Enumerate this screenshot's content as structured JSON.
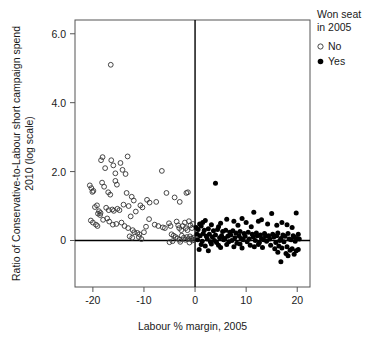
{
  "chart_data": {
    "type": "scatter",
    "title": "",
    "xlabel": "Labour % margin, 2005",
    "ylabel_line1": "Ratio of Conservative-to-Labour short campaign spend",
    "ylabel_line2": "2010 (log scale)",
    "xlim": [
      -23.5,
      22.5
    ],
    "ylim": [
      -1.35,
      6.4
    ],
    "xticks": [
      -20,
      -10,
      0,
      10,
      20
    ],
    "xticklabels": [
      "-20",
      "-10",
      "0",
      "10",
      "20"
    ],
    "yticks": [
      0,
      2.0,
      4.0,
      6.0
    ],
    "yticklabels": [
      "0",
      "2.0",
      "4.0",
      "6.0"
    ],
    "grid": false,
    "reference_lines": {
      "x": 0,
      "y": 0
    },
    "legend": {
      "title_line1": "Won seat",
      "title_line2": "in 2005",
      "position": "right-top",
      "entries": [
        {
          "label": "No",
          "marker": "open-circle",
          "color": "#333333"
        },
        {
          "label": "Yes",
          "marker": "filled-circle",
          "color": "#000000"
        }
      ]
    },
    "series": [
      {
        "name": "No",
        "marker": "open-circle",
        "color": "#333333",
        "points": [
          [
            -16.5,
            5.1
          ],
          [
            -18.4,
            2.33
          ],
          [
            -18.1,
            2.42
          ],
          [
            -17.6,
            2.1
          ],
          [
            -16.4,
            2.33
          ],
          [
            -16.0,
            2.18
          ],
          [
            -15.6,
            1.95
          ],
          [
            -13.2,
            2.44
          ],
          [
            -14.6,
            2.25
          ],
          [
            -14.2,
            2.05
          ],
          [
            -13.6,
            1.93
          ],
          [
            -6.5,
            2.02
          ],
          [
            -20.6,
            1.6
          ],
          [
            -20.3,
            1.52
          ],
          [
            -20.1,
            1.41
          ],
          [
            -19.9,
            1.44
          ],
          [
            -18.2,
            1.68
          ],
          [
            -17.8,
            1.56
          ],
          [
            -15.6,
            1.73
          ],
          [
            -15.3,
            1.62
          ],
          [
            -17.0,
            1.4
          ],
          [
            -16.6,
            1.33
          ],
          [
            -13.4,
            1.38
          ],
          [
            -12.4,
            1.27
          ],
          [
            -12.0,
            1.16
          ],
          [
            -9.4,
            1.18
          ],
          [
            -8.9,
            1.1
          ],
          [
            -7.6,
            1.12
          ],
          [
            -5.6,
            1.38
          ],
          [
            -4.0,
            1.25
          ],
          [
            -3.0,
            1.12
          ],
          [
            -1.7,
            1.38
          ],
          [
            -1.4,
            1.4
          ],
          [
            -19.6,
            0.97
          ],
          [
            -19.2,
            1.02
          ],
          [
            -18.8,
            0.85
          ],
          [
            -18.5,
            0.8
          ],
          [
            -19.0,
            0.78
          ],
          [
            -18.6,
            0.74
          ],
          [
            -17.4,
            0.95
          ],
          [
            -16.9,
            0.88
          ],
          [
            -16.2,
            0.9
          ],
          [
            -15.9,
            0.86
          ],
          [
            -15.2,
            0.92
          ],
          [
            -14.8,
            0.88
          ],
          [
            -14.0,
            1.04
          ],
          [
            -13.0,
            1.0
          ],
          [
            -12.6,
            0.7
          ],
          [
            -11.6,
            0.84
          ],
          [
            -10.7,
            1.02
          ],
          [
            -10.3,
            0.96
          ],
          [
            -9.0,
            0.62
          ],
          [
            -20.4,
            0.58
          ],
          [
            -20.0,
            0.52
          ],
          [
            -19.4,
            0.46
          ],
          [
            -19.1,
            0.42
          ],
          [
            -18.0,
            0.6
          ],
          [
            -17.2,
            0.64
          ],
          [
            -16.8,
            0.55
          ],
          [
            -16.1,
            0.46
          ],
          [
            -15.4,
            0.48
          ],
          [
            -14.4,
            0.52
          ],
          [
            -13.8,
            0.42
          ],
          [
            -13.1,
            0.36
          ],
          [
            -12.2,
            0.3
          ],
          [
            -11.9,
            0.24
          ],
          [
            -11.3,
            0.22
          ],
          [
            -10.9,
            0.18
          ],
          [
            -10.0,
            0.24
          ],
          [
            -9.6,
            0.4
          ],
          [
            -6.3,
            0.38
          ],
          [
            -5.9,
            0.36
          ],
          [
            -5.1,
            0.5
          ],
          [
            -4.8,
            0.42
          ],
          [
            -3.6,
            0.55
          ],
          [
            -3.3,
            0.44
          ],
          [
            -3.1,
            0.36
          ],
          [
            -2.7,
            0.3
          ],
          [
            -2.4,
            0.42
          ],
          [
            -2.0,
            0.52
          ],
          [
            -1.8,
            0.36
          ],
          [
            -1.5,
            0.3
          ],
          [
            -1.2,
            0.56
          ],
          [
            -0.9,
            0.44
          ],
          [
            -0.6,
            0.36
          ],
          [
            -0.4,
            0.48
          ],
          [
            -4.6,
            0.18
          ],
          [
            -4.2,
            0.14
          ],
          [
            -3.8,
            0.1
          ],
          [
            -3.4,
            0.06
          ],
          [
            -3.0,
            0.02
          ],
          [
            -2.6,
            0.14
          ],
          [
            -2.2,
            0.08
          ],
          [
            -1.9,
            0.02
          ],
          [
            -1.6,
            0.1
          ],
          [
            -1.3,
            0.04
          ],
          [
            -1.0,
            0.12
          ],
          [
            -0.7,
            0.06
          ],
          [
            -0.5,
            0.0
          ],
          [
            -0.3,
            0.08
          ],
          [
            -0.2,
            0.02
          ],
          [
            -5.0,
            -0.05
          ],
          [
            -4.4,
            -0.02
          ],
          [
            -2.9,
            -0.04
          ],
          [
            -1.1,
            -0.06
          ],
          [
            -12.8,
            0.12
          ],
          [
            -12.3,
            0.08
          ],
          [
            -11.0,
            0.1
          ],
          [
            -10.5,
            0.04
          ],
          [
            -7.9,
            0.46
          ],
          [
            -7.2,
            0.42
          ]
        ]
      },
      {
        "name": "Yes",
        "marker": "filled-circle",
        "color": "#000000",
        "points": [
          [
            4.0,
            1.66
          ],
          [
            11.5,
            0.82
          ],
          [
            15.0,
            0.78
          ],
          [
            19.8,
            0.8
          ],
          [
            9.2,
            0.64
          ],
          [
            13.0,
            0.6
          ],
          [
            6.2,
            0.62
          ],
          [
            2.0,
            0.58
          ],
          [
            7.6,
            0.56
          ],
          [
            12.4,
            0.56
          ],
          [
            17.0,
            0.52
          ],
          [
            5.0,
            0.5
          ],
          [
            10.0,
            0.52
          ],
          [
            14.2,
            0.48
          ],
          [
            18.0,
            0.46
          ],
          [
            3.2,
            0.46
          ],
          [
            8.4,
            0.44
          ],
          [
            16.0,
            0.44
          ],
          [
            1.2,
            0.42
          ],
          [
            4.6,
            0.4
          ],
          [
            11.0,
            0.4
          ],
          [
            19.0,
            0.38
          ],
          [
            0.6,
            0.32
          ],
          [
            1.8,
            0.3
          ],
          [
            2.6,
            0.34
          ],
          [
            3.6,
            0.28
          ],
          [
            4.4,
            0.32
          ],
          [
            5.4,
            0.26
          ],
          [
            6.0,
            0.3
          ],
          [
            6.8,
            0.24
          ],
          [
            7.4,
            0.28
          ],
          [
            8.0,
            0.22
          ],
          [
            8.8,
            0.26
          ],
          [
            9.6,
            0.2
          ],
          [
            10.4,
            0.24
          ],
          [
            11.2,
            0.18
          ],
          [
            12.0,
            0.22
          ],
          [
            12.8,
            0.16
          ],
          [
            13.6,
            0.2
          ],
          [
            14.4,
            0.14
          ],
          [
            15.2,
            0.18
          ],
          [
            16.2,
            0.22
          ],
          [
            17.2,
            0.16
          ],
          [
            18.2,
            0.2
          ],
          [
            19.2,
            0.14
          ],
          [
            20.2,
            0.18
          ],
          [
            0.4,
            0.18
          ],
          [
            1.0,
            0.14
          ],
          [
            1.6,
            0.2
          ],
          [
            2.2,
            0.12
          ],
          [
            2.8,
            0.18
          ],
          [
            3.4,
            0.1
          ],
          [
            4.0,
            0.16
          ],
          [
            4.8,
            0.08
          ],
          [
            5.2,
            0.14
          ],
          [
            5.8,
            0.06
          ],
          [
            6.4,
            0.12
          ],
          [
            7.0,
            0.16
          ],
          [
            7.8,
            0.08
          ],
          [
            8.6,
            0.14
          ],
          [
            9.0,
            0.06
          ],
          [
            9.8,
            0.12
          ],
          [
            10.6,
            0.04
          ],
          [
            11.4,
            0.1
          ],
          [
            12.2,
            0.14
          ],
          [
            13.0,
            0.06
          ],
          [
            13.8,
            0.12
          ],
          [
            14.6,
            0.04
          ],
          [
            15.4,
            0.1
          ],
          [
            16.0,
            0.14
          ],
          [
            16.8,
            0.06
          ],
          [
            17.6,
            0.12
          ],
          [
            18.4,
            0.04
          ],
          [
            19.4,
            0.1
          ],
          [
            20.0,
            0.06
          ],
          [
            0.5,
            0.02
          ],
          [
            1.4,
            -0.02
          ],
          [
            2.4,
            0.04
          ],
          [
            3.0,
            -0.04
          ],
          [
            3.8,
            0.0
          ],
          [
            4.2,
            -0.06
          ],
          [
            5.6,
            0.02
          ],
          [
            6.6,
            -0.04
          ],
          [
            7.2,
            0.0
          ],
          [
            8.2,
            -0.08
          ],
          [
            9.4,
            0.02
          ],
          [
            10.2,
            -0.04
          ],
          [
            11.8,
            0.0
          ],
          [
            12.6,
            -0.06
          ],
          [
            13.4,
            0.02
          ],
          [
            14.0,
            -0.02
          ],
          [
            15.8,
            -0.06
          ],
          [
            16.6,
            0.0
          ],
          [
            17.4,
            -0.04
          ],
          [
            18.8,
            0.02
          ],
          [
            19.6,
            -0.02
          ],
          [
            20.4,
            0.04
          ],
          [
            1.2,
            -0.12
          ],
          [
            2.0,
            -0.16
          ],
          [
            3.2,
            -0.1
          ],
          [
            4.6,
            -0.14
          ],
          [
            5.0,
            -0.2
          ],
          [
            6.2,
            -0.12
          ],
          [
            7.6,
            -0.18
          ],
          [
            8.8,
            -0.1
          ],
          [
            9.2,
            -0.22
          ],
          [
            10.8,
            -0.14
          ],
          [
            11.6,
            -0.18
          ],
          [
            12.4,
            -0.12
          ],
          [
            13.2,
            -0.2
          ],
          [
            14.8,
            -0.14
          ],
          [
            15.6,
            -0.24
          ],
          [
            16.4,
            -0.16
          ],
          [
            17.0,
            -0.22
          ],
          [
            18.0,
            -0.18
          ],
          [
            18.6,
            -0.28
          ],
          [
            19.0,
            -0.24
          ],
          [
            19.8,
            -0.3
          ],
          [
            20.2,
            -0.26
          ],
          [
            0.8,
            -0.26
          ],
          [
            2.6,
            -0.3
          ],
          [
            16.2,
            -0.34
          ],
          [
            17.8,
            -0.38
          ],
          [
            19.4,
            -0.4
          ],
          [
            18.2,
            -0.44
          ],
          [
            16.8,
            -0.62
          ],
          [
            0.2,
            0.38
          ],
          [
            0.9,
            0.48
          ],
          [
            1.5,
            0.52
          ]
        ]
      }
    ]
  }
}
